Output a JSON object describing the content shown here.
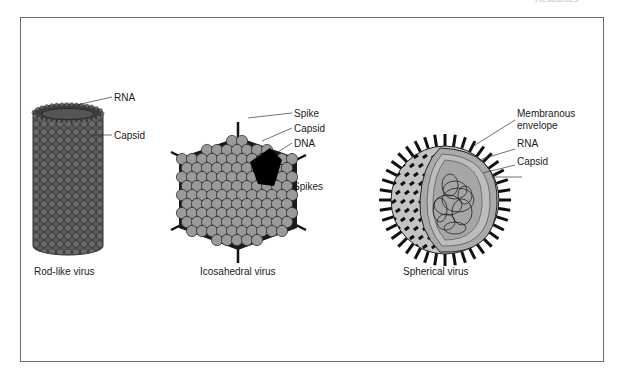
{
  "header": {
    "cropped_text": "Resources"
  },
  "figure": {
    "panels": [
      {
        "id": "rod",
        "caption": "Rod-like virus",
        "labels": [
          "RNA",
          "Capsid"
        ]
      },
      {
        "id": "icosahedral",
        "caption": "Icosahedral virus",
        "labels": [
          "Spike",
          "Capsid",
          "DNA",
          "Spikes"
        ]
      },
      {
        "id": "spherical",
        "caption": "Spherical virus",
        "labels": [
          "Membranous",
          "envelope",
          "RNA",
          "Capsid"
        ]
      }
    ]
  },
  "colors": {
    "capsid_dark": "#5a5a5a",
    "capsid_light": "#9a9a9a",
    "dna": "#000000",
    "envelope": "#c8c8c8",
    "frame": "#6e6e6e"
  }
}
